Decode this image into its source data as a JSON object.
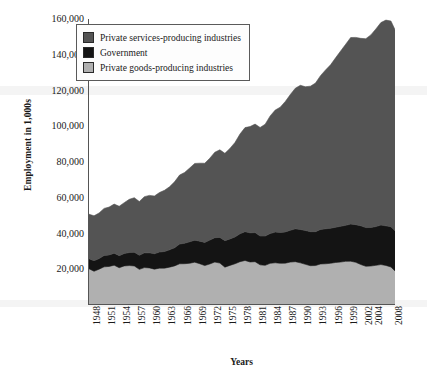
{
  "chart_data": {
    "type": "area",
    "stacked": true,
    "title": "",
    "xlabel": "Years",
    "ylabel": "Employment in 1,000s",
    "ylim": [
      0,
      160000
    ],
    "yticks": [
      "160,000",
      "140,000",
      "120,000",
      "100,000",
      "80,000",
      "60,000",
      "40,000",
      "20,000"
    ],
    "ytick_values": [
      160000,
      140000,
      120000,
      100000,
      80000,
      60000,
      40000,
      20000
    ],
    "grid": false,
    "legend_position": "top-left",
    "xlim": [
      1948,
      2009
    ],
    "tick_labels": [
      "1948",
      "1951",
      "1954",
      "1957",
      "1960",
      "1963",
      "1966",
      "1969",
      "1972",
      "1975",
      "1978",
      "1981",
      "1984",
      "1987",
      "1990",
      "1993",
      "1996",
      "1999",
      "2002",
      "2004",
      "2008"
    ],
    "x": [
      1948,
      1949,
      1950,
      1951,
      1952,
      1953,
      1954,
      1955,
      1956,
      1957,
      1958,
      1959,
      1960,
      1961,
      1962,
      1963,
      1964,
      1965,
      1966,
      1967,
      1968,
      1969,
      1970,
      1971,
      1972,
      1973,
      1974,
      1975,
      1976,
      1977,
      1978,
      1979,
      1980,
      1981,
      1982,
      1983,
      1984,
      1985,
      1986,
      1987,
      1988,
      1989,
      1990,
      1991,
      1992,
      1993,
      1994,
      1995,
      1996,
      1997,
      1998,
      1999,
      2000,
      2001,
      2002,
      2003,
      2004,
      2005,
      2006,
      2007,
      2008,
      2009
    ],
    "series": [
      {
        "name": "Private goods-producing industries",
        "color": "#b0b0b0",
        "values": [
          20200,
          19000,
          19900,
          21200,
          21600,
          22300,
          20800,
          21900,
          22100,
          21700,
          19900,
          20900,
          20800,
          20000,
          20500,
          20600,
          21000,
          21900,
          22900,
          23000,
          23300,
          23800,
          23000,
          22200,
          22900,
          23900,
          23600,
          21300,
          22200,
          23100,
          24200,
          24900,
          24200,
          24100,
          22600,
          22100,
          23400,
          23600,
          23300,
          23500,
          23900,
          24100,
          23700,
          22600,
          22100,
          22200,
          22800,
          23200,
          23400,
          23900,
          24200,
          24300,
          24600,
          23900,
          22600,
          21800,
          21900,
          22200,
          22500,
          22200,
          21300,
          18600
        ]
      },
      {
        "name": "Government",
        "color": "#141414",
        "values": [
          5500,
          5900,
          6000,
          6400,
          6600,
          6800,
          6900,
          7000,
          7300,
          7600,
          7800,
          8100,
          8400,
          8600,
          8900,
          9200,
          9600,
          10100,
          11000,
          11600,
          12000,
          12200,
          12500,
          12900,
          13300,
          13700,
          14200,
          14700,
          14900,
          15100,
          15600,
          16000,
          16300,
          16300,
          16200,
          16300,
          16700,
          17000,
          17300,
          17600,
          17900,
          18300,
          18700,
          18900,
          19000,
          19100,
          19300,
          19400,
          19500,
          19700,
          19900,
          20200,
          20800,
          21100,
          21500,
          21600,
          21600,
          21800,
          22000,
          22200,
          22500,
          22500
        ]
      },
      {
        "name": "Private services-producing industries",
        "color": "#545454",
        "values": [
          25000,
          25000,
          25400,
          26200,
          26900,
          27600,
          27600,
          28600,
          29700,
          30300,
          30000,
          31300,
          32200,
          32400,
          33300,
          34100,
          35300,
          36800,
          38500,
          39700,
          41200,
          42900,
          43600,
          44200,
          45900,
          47800,
          49100,
          48800,
          50600,
          52800,
          55700,
          58300,
          59500,
          60600,
          60800,
          62400,
          65700,
          68100,
          70200,
          72900,
          75900,
          78700,
          80600,
          80500,
          81300,
          83200,
          86100,
          88900,
          91600,
          94900,
          98000,
          101200,
          104400,
          104800,
          104700,
          105600,
          107700,
          110400,
          113100,
          115200,
          115000,
          111800
        ]
      }
    ],
    "totals_note": ""
  },
  "legend": {
    "items": [
      {
        "label": "Private services-producing industries",
        "color": "#545454"
      },
      {
        "label": "Government",
        "color": "#141414"
      },
      {
        "label": "Private goods-producing industries",
        "color": "#b0b0b0"
      }
    ]
  },
  "axes": {
    "y_title": "Employment in 1,000s",
    "x_title": "Years"
  }
}
